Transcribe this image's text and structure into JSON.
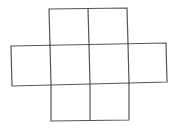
{
  "diagram": {
    "type": "net-of-squares",
    "stroke_color": "#555555",
    "background_color": "#ffffff",
    "rows": [
      {
        "name": "top",
        "square_count": 2
      },
      {
        "name": "middle",
        "square_count": 4
      },
      {
        "name": "bottom",
        "square_count": 2
      }
    ],
    "total_squares": 8
  }
}
